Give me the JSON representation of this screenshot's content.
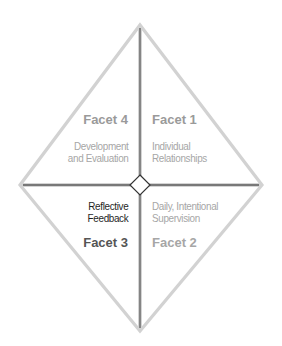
{
  "diagram": {
    "geometry": {
      "apex": [
        140,
        25
      ],
      "left": [
        20,
        185
      ],
      "right": [
        262,
        185
      ],
      "bottom": [
        140,
        331
      ],
      "center": [
        140,
        185
      ],
      "center_diamond_half": 10
    },
    "colors": {
      "outline": "#d2d2d2",
      "divider_core": "#555555",
      "divider_halo": "#cfcfcf",
      "center_diamond_stroke": "#333333",
      "center_diamond_fill": "#ffffff",
      "facet_title_muted": "#9a9a9a",
      "facet_desc_muted": "#a6a6a6",
      "facet_title_active": "#555555",
      "facet_desc_active": "#1f1f1f"
    },
    "facets": [
      {
        "id": "facet-4",
        "quadrant": "top-left",
        "title": "Facet 4",
        "description_lines": [
          "Development",
          "and Evaluation"
        ],
        "highlighted": false
      },
      {
        "id": "facet-1",
        "quadrant": "top-right",
        "title": "Facet 1",
        "description_lines": [
          "Individual",
          "Relationships"
        ],
        "highlighted": false
      },
      {
        "id": "facet-3",
        "quadrant": "bottom-left",
        "title": "Facet 3",
        "description_lines": [
          "Reflective",
          "Feedback"
        ],
        "highlighted": true
      },
      {
        "id": "facet-2",
        "quadrant": "bottom-right",
        "title": "Facet 2",
        "description_lines": [
          "Daily, Intentional",
          "Supervision"
        ],
        "highlighted": false
      }
    ]
  }
}
